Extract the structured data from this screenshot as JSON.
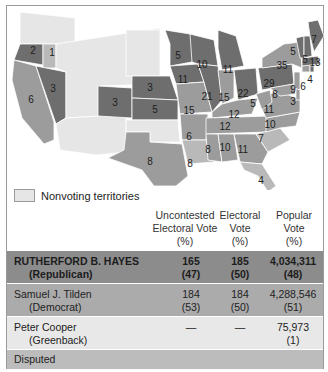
{
  "colors": {
    "republican": "#6e6e6e",
    "democrat": "#9c9c9c",
    "disputed": "#b9b9b9",
    "territory": "#e6e6e6",
    "border": "#ffffff",
    "row_hayes": "#8c8c8c",
    "row_tilden": "#ababab",
    "row_cooper": "#e8e8e8",
    "row_disputed": "#bcbcbc"
  },
  "map": {
    "states": [
      {
        "id": "WA-territory",
        "party": "territory",
        "label": "",
        "pts": "20,12 75,18 75,44 20,44"
      },
      {
        "id": "OR",
        "party": "republican",
        "label": "2",
        "pts": "20,44 43,44 43,65 14,60"
      },
      {
        "id": "OR-disputed",
        "party": "disputed",
        "label": "1",
        "pts": "43,44 56,44 56,68 43,68"
      },
      {
        "id": "CA",
        "party": "democrat",
        "label": "6",
        "pts": "14,60 36,66 54,122 54,140 44,144 22,118 12,80"
      },
      {
        "id": "NV",
        "party": "republican",
        "label": "3",
        "pts": "36,66 66,72 66,118 56,124"
      },
      {
        "id": "ID-MT-WY-UT-territories",
        "party": "territory",
        "label": "",
        "pts": "56,44 160,28 160,84 100,86 100,116 66,118 66,72 56,68"
      },
      {
        "id": "AZ-NM-territories",
        "party": "territory",
        "label": "",
        "pts": "56,124 66,118 100,116 126,116 126,152 96,155 60,150"
      },
      {
        "id": "Dakota-territory",
        "party": "territory",
        "label": "",
        "pts": "126,30 160,30 160,76 126,76"
      },
      {
        "id": "CO",
        "party": "republican",
        "label": "3",
        "pts": "98,86 132,88 132,118 98,116"
      },
      {
        "id": "NE",
        "party": "republican",
        "label": "3",
        "pts": "132,76 170,76 178,100 132,98"
      },
      {
        "id": "KS",
        "party": "republican",
        "label": "5",
        "pts": "132,98 178,100 178,120 132,120"
      },
      {
        "id": "Indian-territory",
        "party": "territory",
        "label": "",
        "pts": "126,120 178,120 180,142 150,142 150,132 126,132"
      },
      {
        "id": "TX",
        "party": "democrat",
        "label": "8",
        "pts": "126,132 150,132 150,142 182,144 188,176 176,186 154,186 142,170 108,158 124,150"
      },
      {
        "id": "MN",
        "party": "republican",
        "label": "5",
        "pts": "165,30 190,34 200,48 192,62 170,66 170,44"
      },
      {
        "id": "IA",
        "party": "republican",
        "label": "11",
        "pts": "170,66 198,64 204,82 176,84"
      },
      {
        "id": "MO",
        "party": "democrat",
        "label": "15",
        "pts": "176,84 204,82 212,112 180,114"
      },
      {
        "id": "AR",
        "party": "democrat",
        "label": "6",
        "pts": "180,114 208,114 206,140 182,140"
      },
      {
        "id": "LA",
        "party": "disputed",
        "label": "8",
        "pts": "182,140 206,140 214,162 188,164"
      },
      {
        "id": "WI",
        "party": "republican",
        "label": "10",
        "pts": "190,34 214,40 218,66 198,64 192,62"
      },
      {
        "id": "IL",
        "party": "republican",
        "label": "21",
        "pts": "198,64 218,66 222,100 212,112 204,82"
      },
      {
        "id": "MI",
        "party": "republican",
        "label": "11",
        "pts": "218,30 236,36 244,66 222,70 218,48"
      },
      {
        "id": "IN",
        "party": "democrat",
        "label": "15",
        "pts": "218,70 234,70 234,98 222,104"
      },
      {
        "id": "OH",
        "party": "republican",
        "label": "22",
        "pts": "234,70 256,68 258,94 238,100"
      },
      {
        "id": "KY",
        "party": "democrat",
        "label": "12",
        "pts": "212,112 222,104 238,100 258,98 252,114 212,118"
      },
      {
        "id": "TN",
        "party": "democrat",
        "label": "12",
        "pts": "206,118 270,116 266,132 206,134"
      },
      {
        "id": "MS",
        "party": "democrat",
        "label": "8",
        "pts": "206,134 218,134 222,162 208,160"
      },
      {
        "id": "AL",
        "party": "democrat",
        "label": "10",
        "pts": "218,134 234,134 238,160 222,162"
      },
      {
        "id": "GA",
        "party": "democrat",
        "label": "11",
        "pts": "234,134 256,134 268,152 262,164 240,162"
      },
      {
        "id": "FL",
        "party": "disputed",
        "label": "4",
        "pts": "240,162 262,164 276,186 268,192 258,176 244,170"
      },
      {
        "id": "SC",
        "party": "disputed",
        "label": "7",
        "pts": "256,134 280,128 290,140 268,152"
      },
      {
        "id": "NC",
        "party": "democrat",
        "label": "10",
        "pts": "266,118 300,112 296,126 280,128 266,132"
      },
      {
        "id": "VA",
        "party": "democrat",
        "label": "11",
        "pts": "258,100 278,90 300,100 300,112 266,118"
      },
      {
        "id": "WV",
        "party": "democrat",
        "label": "5",
        "pts": "256,94 270,90 272,102 262,110"
      },
      {
        "id": "PA",
        "party": "republican",
        "label": "29",
        "pts": "258,68 292,64 294,84 262,90"
      },
      {
        "id": "MD",
        "party": "democrat",
        "label": "8",
        "pts": "270,88 294,84 296,94 280,96"
      },
      {
        "id": "DE",
        "party": "democrat",
        "label": "3",
        "pts": "296,88 300,88 300,100 296,100"
      },
      {
        "id": "NJ",
        "party": "democrat",
        "label": "9",
        "pts": "294,72 300,72 300,90 294,88"
      },
      {
        "id": "NY",
        "party": "democrat",
        "label": "35",
        "pts": "262,58 284,44 300,42 302,68 292,64 262,68"
      },
      {
        "id": "CT",
        "party": "democrat",
        "label": "6",
        "pts": "302,66 310,64 310,72 302,72"
      },
      {
        "id": "RI",
        "party": "republican",
        "label": "4",
        "pts": "310,66 314,66 314,72 310,72"
      },
      {
        "id": "MA",
        "party": "republican",
        "label": "13",
        "pts": "302,58 318,56 320,64 302,66"
      },
      {
        "id": "VT",
        "party": "republican",
        "label": "5",
        "pts": "296,38 304,36 304,58 300,58"
      },
      {
        "id": "NH",
        "party": "republican",
        "label": "5",
        "pts": "304,36 310,36 312,56 304,58"
      },
      {
        "id": "ME",
        "party": "republican",
        "label": "7",
        "pts": "308,22 318,20 324,36 314,52 310,36"
      }
    ],
    "labels": [
      {
        "state": "OR",
        "text": "2",
        "x": 33,
        "y": 51
      },
      {
        "state": "OR-disputed",
        "text": "1",
        "x": 52,
        "y": 53
      },
      {
        "state": "CA",
        "text": "6",
        "x": 31,
        "y": 100
      },
      {
        "state": "NV",
        "text": "3",
        "x": 53,
        "y": 89
      },
      {
        "state": "CO",
        "text": "3",
        "x": 115,
        "y": 103
      },
      {
        "state": "NE",
        "text": "3",
        "x": 150,
        "y": 88
      },
      {
        "state": "KS",
        "text": "5",
        "x": 155,
        "y": 110
      },
      {
        "state": "TX",
        "text": "8",
        "x": 150,
        "y": 162
      },
      {
        "state": "MN",
        "text": "5",
        "x": 178,
        "y": 56
      },
      {
        "state": "IA",
        "text": "11",
        "x": 183,
        "y": 80
      },
      {
        "state": "MO",
        "text": "15",
        "x": 189,
        "y": 111
      },
      {
        "state": "AR",
        "text": "6",
        "x": 189,
        "y": 137
      },
      {
        "state": "LA",
        "text": "8",
        "x": 190,
        "y": 164
      },
      {
        "state": "WI",
        "text": "10",
        "x": 202,
        "y": 65
      },
      {
        "state": "IL",
        "text": "21",
        "x": 207,
        "y": 97
      },
      {
        "state": "MI",
        "text": "11",
        "x": 228,
        "y": 70
      },
      {
        "state": "IN",
        "text": "15",
        "x": 224,
        "y": 98
      },
      {
        "state": "OH",
        "text": "22",
        "x": 243,
        "y": 94
      },
      {
        "state": "KY",
        "text": "12",
        "x": 234,
        "y": 115
      },
      {
        "state": "TN",
        "text": "12",
        "x": 225,
        "y": 127
      },
      {
        "state": "MS",
        "text": "8",
        "x": 208,
        "y": 150
      },
      {
        "state": "AL",
        "text": "10",
        "x": 225,
        "y": 148
      },
      {
        "state": "GA",
        "text": "11",
        "x": 243,
        "y": 150
      },
      {
        "state": "FL",
        "text": "4",
        "x": 261,
        "y": 181
      },
      {
        "state": "SC",
        "text": "7",
        "x": 261,
        "y": 139
      },
      {
        "state": "NC",
        "text": "10",
        "x": 270,
        "y": 125
      },
      {
        "state": "VA",
        "text": "11",
        "x": 269,
        "y": 110
      },
      {
        "state": "WV",
        "text": "5",
        "x": 253,
        "y": 104
      },
      {
        "state": "PA",
        "text": "29",
        "x": 269,
        "y": 84
      },
      {
        "state": "MD",
        "text": "8",
        "x": 275,
        "y": 95
      },
      {
        "state": "DE",
        "text": "3",
        "x": 293,
        "y": 102
      },
      {
        "state": "NJ",
        "text": "9",
        "x": 293,
        "y": 90
      },
      {
        "state": "NY",
        "text": "35",
        "x": 282,
        "y": 66
      },
      {
        "state": "CT",
        "text": "6",
        "x": 303,
        "y": 87
      },
      {
        "state": "RI",
        "text": "4",
        "x": 310,
        "y": 80
      },
      {
        "state": "MA",
        "text": "13",
        "x": 315,
        "y": 63
      },
      {
        "state": "VT",
        "text": "5",
        "x": 293,
        "y": 52
      },
      {
        "state": "NH",
        "text": "5",
        "x": 305,
        "y": 60
      },
      {
        "state": "ME",
        "text": "7",
        "x": 314,
        "y": 40
      }
    ]
  },
  "legend": {
    "label": "Nonvoting territories"
  },
  "table": {
    "columns": [
      {
        "line1": "Uncontested",
        "line2": "Electoral Vote",
        "line3": "(%)"
      },
      {
        "line1": "Electoral",
        "line2": "Vote",
        "line3": "(%)"
      },
      {
        "line1": "Popular",
        "line2": "Vote",
        "line3": "(%)"
      }
    ],
    "rows": [
      {
        "name": "RUTHERFORD B. HAYES",
        "party": "(Republican)",
        "uncontested": "165",
        "uncontested_pct": "(47)",
        "electoral": "185",
        "electoral_pct": "(50)",
        "popular": "4,034,311",
        "popular_pct": "(48)"
      },
      {
        "name": "Samuel J. Tilden",
        "party": "(Democrat)",
        "uncontested": "184",
        "uncontested_pct": "(53)",
        "electoral": "184",
        "electoral_pct": "(50)",
        "popular": "4,288,546",
        "popular_pct": "(51)"
      },
      {
        "name": "Peter Cooper",
        "party": "(Greenback)",
        "uncontested": "—",
        "uncontested_pct": "",
        "electoral": "—",
        "electoral_pct": "",
        "popular": "75,973",
        "popular_pct": "(1)"
      },
      {
        "name": "Disputed",
        "party": "",
        "uncontested": "",
        "uncontested_pct": "",
        "electoral": "",
        "electoral_pct": "",
        "popular": "",
        "popular_pct": ""
      }
    ]
  }
}
